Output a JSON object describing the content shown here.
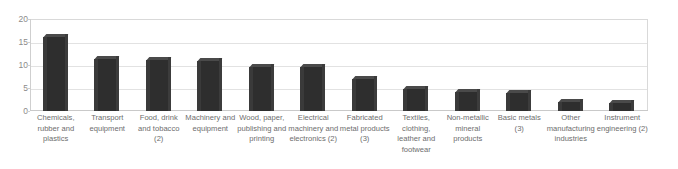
{
  "chart_data": {
    "type": "bar",
    "title": "",
    "subtitle": "",
    "xlabel": "",
    "ylabel": "",
    "ylim": [
      0,
      20
    ],
    "yticks": [
      0,
      5,
      10,
      15,
      20
    ],
    "grid": true,
    "legend": false,
    "orientation": "vertical",
    "bar_style": "3d-column-dark",
    "bar_color": "#2e2e2e",
    "categories": [
      "Chemicals, rubber and plastics",
      "Transport equipment",
      "Food, drink and tobacco (2)",
      "Machinery and equipment",
      "Wood, paper, publishing and printing",
      "Electrical machinery and electronics (2)",
      "Fabricated metal products (3)",
      "Textiles, clothing, leather and footwear",
      "Non-metallic mineral products",
      "Basic metals (3)",
      "Other manufacturing industries",
      "Instrument engineering (2)"
    ],
    "values": [
      16.0,
      11.2,
      11.0,
      10.8,
      9.6,
      9.5,
      7.0,
      4.7,
      4.2,
      4.0,
      2.0,
      1.8
    ]
  },
  "axis": {
    "y_tick_labels": [
      "20",
      "15",
      "10",
      "5",
      "0"
    ],
    "y_tick_values": [
      20,
      15,
      10,
      5,
      0
    ]
  },
  "colors": {
    "bar": "#2e2e2e",
    "bar_top": "#4a4a4a",
    "gridline": "#e2e2e2",
    "frame": "#d9d9d9",
    "tick_text": "#8a8a8a",
    "label_text": "#6d6d6d",
    "background": "#ffffff"
  }
}
